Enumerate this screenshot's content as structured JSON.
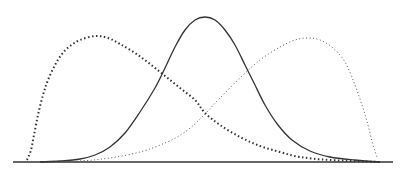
{
  "chart_data": {
    "type": "line",
    "title": "",
    "xlabel": "",
    "ylabel": "",
    "grid": false,
    "legend": null,
    "x_range": [
      0,
      1
    ],
    "baseline": {
      "x1": 13,
      "x2": 393,
      "y": 162,
      "color": "#333333"
    },
    "series": [
      {
        "name": "right-skewed (left peak)",
        "style": "dotted-heavy",
        "color": "#333333",
        "peak_x_px": 95,
        "peak_y_px": 36,
        "start_x_px": 27,
        "end_x_px": 380,
        "points_px": [
          [
            27,
            160
          ],
          [
            31,
            150
          ],
          [
            34,
            135
          ],
          [
            38,
            115
          ],
          [
            43,
            95
          ],
          [
            48,
            80
          ],
          [
            55,
            65
          ],
          [
            62,
            54
          ],
          [
            70,
            46
          ],
          [
            80,
            40
          ],
          [
            95,
            36
          ],
          [
            108,
            38
          ],
          [
            120,
            44
          ],
          [
            135,
            53
          ],
          [
            150,
            64
          ],
          [
            165,
            76
          ],
          [
            180,
            88
          ],
          [
            195,
            100
          ],
          [
            205,
            113
          ],
          [
            220,
            125
          ],
          [
            240,
            137
          ],
          [
            260,
            146
          ],
          [
            280,
            152
          ],
          [
            300,
            157
          ],
          [
            330,
            160
          ],
          [
            380,
            162
          ]
        ]
      },
      {
        "name": "symmetric (center peak)",
        "style": "solid",
        "color": "#333333",
        "peak_x_px": 205,
        "peak_y_px": 17,
        "start_x_px": 40,
        "end_x_px": 380,
        "points_px": [
          [
            40,
            162
          ],
          [
            60,
            161
          ],
          [
            80,
            159
          ],
          [
            95,
            155
          ],
          [
            110,
            147
          ],
          [
            125,
            133
          ],
          [
            140,
            112
          ],
          [
            155,
            88
          ],
          [
            165,
            68
          ],
          [
            175,
            47
          ],
          [
            185,
            30
          ],
          [
            195,
            20
          ],
          [
            205,
            17
          ],
          [
            215,
            20
          ],
          [
            225,
            30
          ],
          [
            235,
            45
          ],
          [
            245,
            65
          ],
          [
            255,
            85
          ],
          [
            265,
            105
          ],
          [
            278,
            125
          ],
          [
            292,
            140
          ],
          [
            310,
            151
          ],
          [
            330,
            157
          ],
          [
            355,
            160
          ],
          [
            380,
            162
          ]
        ]
      },
      {
        "name": "left-skewed (right peak)",
        "style": "dotted-fine",
        "color": "#555555",
        "peak_x_px": 308,
        "peak_y_px": 38,
        "start_x_px": 45,
        "end_x_px": 377,
        "points_px": [
          [
            45,
            162
          ],
          [
            80,
            161
          ],
          [
            110,
            158
          ],
          [
            140,
            152
          ],
          [
            165,
            143
          ],
          [
            185,
            132
          ],
          [
            203,
            116
          ],
          [
            220,
            98
          ],
          [
            240,
            78
          ],
          [
            260,
            60
          ],
          [
            280,
            47
          ],
          [
            295,
            40
          ],
          [
            308,
            38
          ],
          [
            320,
            40
          ],
          [
            333,
            48
          ],
          [
            345,
            62
          ],
          [
            355,
            85
          ],
          [
            362,
            105
          ],
          [
            368,
            125
          ],
          [
            373,
            145
          ],
          [
            377,
            157
          ]
        ]
      }
    ]
  }
}
